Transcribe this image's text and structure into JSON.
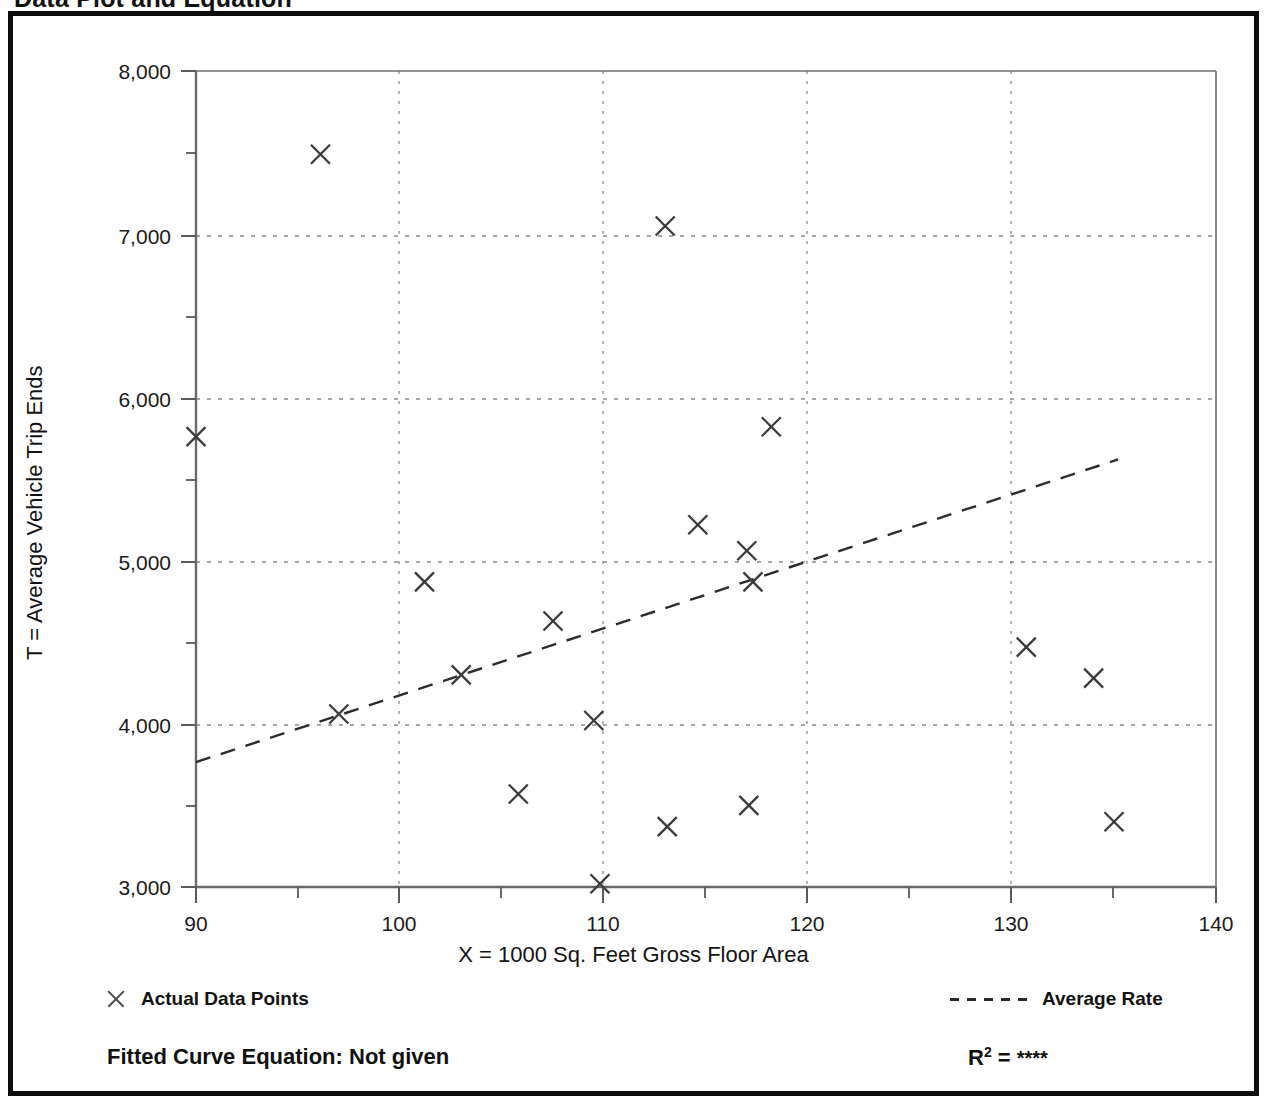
{
  "page": {
    "heading": "Data Plot and Equation"
  },
  "footer": {
    "fitted_curve_label": "Fitted Curve Equation:  Not given",
    "r_squared_symbol": "R",
    "r_squared_exponent": "2",
    "r_squared_equals": " = ",
    "r_squared_value": "****"
  },
  "legend": {
    "position": "below-axis",
    "entries": [
      {
        "marker": "x-marker-icon",
        "label": "Actual Data Points"
      },
      {
        "marker": "dashed-line-icon",
        "label": "Average Rate"
      }
    ]
  },
  "colors": {
    "frame": "#0d0d0d",
    "axis": "#5a5a5a",
    "gridline": "#8a8a8a",
    "marker": "#3a3a3a",
    "trend_line": "#2b2b2b",
    "text": "#111111",
    "background": "#ffffff"
  },
  "chart_data": {
    "type": "scatter",
    "title": "Data Plot and Equation",
    "xlabel": "X = 1000 Sq. Feet Gross Floor Area",
    "ylabel": "T = Average Vehicle Trip Ends",
    "xlim": [
      90,
      140
    ],
    "ylim": [
      3000,
      8000
    ],
    "xticks": [
      90,
      100,
      110,
      120,
      130,
      140
    ],
    "xtick_labels": [
      "90",
      "100",
      "110",
      "120",
      "130",
      "140"
    ],
    "xminorticks": [
      95,
      105,
      115,
      125,
      135
    ],
    "yticks": [
      3000,
      4000,
      5000,
      6000,
      7000,
      8000
    ],
    "ytick_labels": [
      "3,000",
      "4,000",
      "5,000",
      "6,000",
      "7,000",
      "8,000"
    ],
    "yminorticks": [
      3500,
      4500,
      5500,
      6500,
      7500
    ],
    "grid": true,
    "grid_style": "dotted",
    "series": [
      {
        "name": "Actual Data Points",
        "type": "scatter",
        "marker": "x",
        "points": [
          {
            "x": 90.0,
            "y": 5760
          },
          {
            "x": 96.1,
            "y": 7490
          },
          {
            "x": 97.0,
            "y": 4060
          },
          {
            "x": 101.2,
            "y": 4870
          },
          {
            "x": 103.0,
            "y": 4300
          },
          {
            "x": 105.8,
            "y": 3570
          },
          {
            "x": 107.5,
            "y": 4630
          },
          {
            "x": 109.5,
            "y": 4020
          },
          {
            "x": 109.8,
            "y": 3020
          },
          {
            "x": 113.0,
            "y": 7050
          },
          {
            "x": 113.1,
            "y": 3370
          },
          {
            "x": 114.6,
            "y": 5220
          },
          {
            "x": 117.0,
            "y": 5060
          },
          {
            "x": 117.1,
            "y": 3500
          },
          {
            "x": 117.3,
            "y": 4870
          },
          {
            "x": 118.2,
            "y": 5820
          },
          {
            "x": 130.7,
            "y": 4470
          },
          {
            "x": 134.0,
            "y": 4280
          },
          {
            "x": 135.0,
            "y": 3400
          }
        ]
      },
      {
        "name": "Average Rate",
        "type": "line",
        "style": "dashed",
        "endpoints": [
          {
            "x": 90.0,
            "y": 3765
          },
          {
            "x": 135.2,
            "y": 5620
          }
        ]
      }
    ]
  }
}
